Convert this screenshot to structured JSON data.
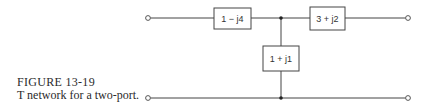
{
  "figure": {
    "label": "FIGURE 13-19",
    "caption": "T network for a two-port."
  },
  "circuit": {
    "type": "T network",
    "series_impedance_1": "1 − j4",
    "series_impedance_2": "3 + j2",
    "shunt_impedance": "1 + j1",
    "labels": {
      "z1": "1 − j4",
      "z2": "3 + j2",
      "z3": "1 + j1"
    },
    "terminals": [
      "input-top",
      "input-bottom",
      "output-top",
      "output-bottom"
    ],
    "line_color": "#444444"
  }
}
